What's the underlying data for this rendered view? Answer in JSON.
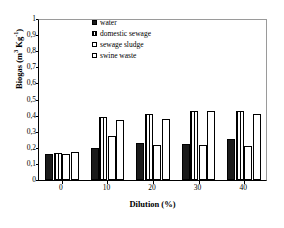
{
  "chart_data": {
    "type": "bar",
    "title": "",
    "xlabel": "Dilution (%)",
    "ylabel": "Biogas (m³ Kg⁻¹)",
    "ylabel_base": "Biogas (m",
    "ylabel_sup1": "3",
    "ylabel_mid": " Kg",
    "ylabel_sup2": "-1",
    "ylabel_end": ")",
    "categories": [
      "0",
      "10",
      "20",
      "30",
      "40"
    ],
    "x_tick_labels": [
      "0",
      "10",
      "20",
      "30",
      "40"
    ],
    "y_tick_labels": [
      "0",
      "0,1",
      "0,2",
      "0,3",
      "0,4",
      "0,5",
      "0,6",
      "0,7",
      "0,8",
      "0,9",
      "1"
    ],
    "y_tick_values": [
      0,
      0.1,
      0.2,
      0.3,
      0.4,
      0.5,
      0.6,
      0.7,
      0.8,
      0.9,
      1
    ],
    "ylim": [
      0,
      1
    ],
    "grid": false,
    "legend_position": "top-center",
    "series": [
      {
        "name": "water",
        "fill": "solid-black",
        "color": "#1a1a1a",
        "values": [
          0.162,
          0.2,
          0.232,
          0.224,
          0.255
        ]
      },
      {
        "name": "domestic sewage",
        "fill": "vertical-stripes",
        "color": "#ffffff",
        "values": [
          0.167,
          0.389,
          0.408,
          0.428,
          0.429
        ]
      },
      {
        "name": "sewage sludge",
        "fill": "dotted",
        "color": "#ffffff",
        "values": [
          0.164,
          0.274,
          0.216,
          0.217,
          0.211
        ]
      },
      {
        "name": "swine waste",
        "fill": "open-white",
        "color": "#ffffff",
        "values": [
          0.176,
          0.371,
          0.382,
          0.428,
          0.407
        ]
      }
    ]
  },
  "legend": {
    "items": [
      {
        "label": "water",
        "swatch": "water-swatch"
      },
      {
        "label": "domestic sewage",
        "swatch": "domestic-sewage-swatch"
      },
      {
        "label": "sewage sludge",
        "swatch": "sewage-sludge-swatch"
      },
      {
        "label": "swine waste",
        "swatch": "swine-waste-swatch"
      }
    ]
  }
}
